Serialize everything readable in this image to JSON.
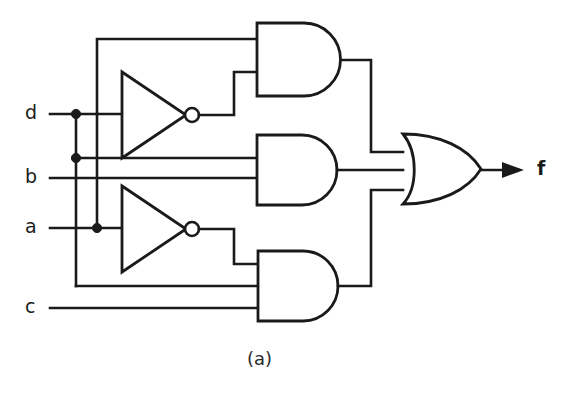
{
  "figure": {
    "caption": "(a)",
    "caption_x": 247,
    "caption_y": 348,
    "background_color": "#ffffff",
    "line_color": "#1a1a1a",
    "width": 572,
    "height": 396
  },
  "inputs": [
    {
      "name": "input-d",
      "label": "d",
      "x": 28,
      "y": 104,
      "wire_y": 114
    },
    {
      "name": "input-b",
      "label": "b",
      "x": 28,
      "y": 168,
      "wire_y": 178
    },
    {
      "name": "input-a",
      "label": "a",
      "x": 28,
      "y": 218,
      "wire_y": 228
    },
    {
      "name": "input-c",
      "label": "c",
      "x": 28,
      "y": 298,
      "wire_y": 308
    }
  ],
  "outputs": [
    {
      "name": "output-f",
      "label": "f",
      "x": 538,
      "y": 160,
      "wire_y": 170
    }
  ],
  "gates": [
    {
      "id": "inverter-d",
      "type": "NOT",
      "label": "inverter-top",
      "input_signal": "d",
      "x": 122,
      "y": 72,
      "width": 64,
      "height": 86,
      "center_y": 115
    },
    {
      "id": "inverter-a",
      "type": "NOT",
      "label": "inverter-bottom",
      "input_signal": "a",
      "x": 122,
      "y": 186,
      "width": 64,
      "height": 86,
      "center_y": 229
    },
    {
      "id": "and-top",
      "type": "AND",
      "label": "and-gate-top",
      "inputs": [
        "d-bus",
        "not-d"
      ],
      "x": 257,
      "y": 23,
      "width": 92,
      "height": 73,
      "output_y": 60
    },
    {
      "id": "and-middle",
      "type": "AND",
      "label": "and-gate-middle",
      "inputs": [
        "d-bus",
        "b"
      ],
      "x": 257,
      "y": 135,
      "width": 92,
      "height": 70,
      "output_y": 170
    },
    {
      "id": "and-bottom",
      "type": "AND",
      "label": "and-gate-bottom",
      "inputs": [
        "not-a",
        "d-bus",
        "c"
      ],
      "x": 257,
      "y": 251,
      "width": 92,
      "height": 70,
      "output_y": 286
    },
    {
      "id": "or-out",
      "type": "OR",
      "label": "or-gate-output",
      "inputs": [
        "and-top",
        "and-middle",
        "and-bottom"
      ],
      "x": 403,
      "y": 134,
      "width": 78,
      "height": 70,
      "output_y": 170
    }
  ],
  "junctions": [
    {
      "name": "junction-d-a-bus",
      "x": 97,
      "y": 114
    },
    {
      "name": "junction-d-lower-bus",
      "x": 76,
      "y": 158
    },
    {
      "name": "junction-a-bus",
      "x": 97,
      "y": 228
    }
  ]
}
